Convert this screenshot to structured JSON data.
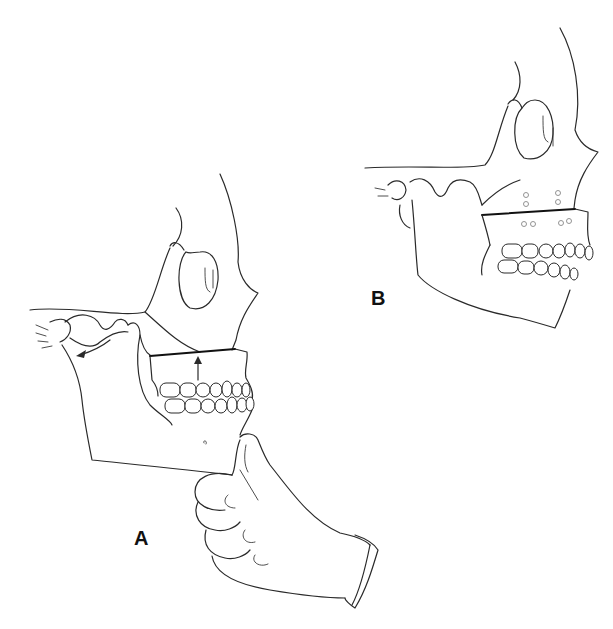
{
  "figure": {
    "panels": [
      {
        "id": "A",
        "label": "A",
        "content": "Skull lateral view with gloved hand gripping chin; arrow at condyle pointing downward-forward; upward arrow below maxillary cut line"
      },
      {
        "id": "B",
        "label": "B",
        "content": "Skull lateral view with maxilla repositioned; cut line with small fixation screw holes above and below"
      }
    ],
    "colors": {
      "line": "#2a2a2a",
      "cut_line": "#111111",
      "background": "#ffffff"
    }
  }
}
